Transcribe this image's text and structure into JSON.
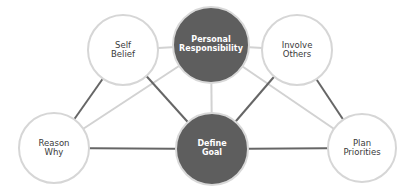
{
  "diagram": {
    "nodes": [
      {
        "id": "self-belief",
        "line1": "Self",
        "line2": "Belief",
        "style": "light",
        "cx": 123,
        "cy": 50,
        "r": 36
      },
      {
        "id": "personal-responsibility",
        "line1": "Personal",
        "line2": "Responsibility",
        "style": "dark",
        "cx": 211,
        "cy": 45,
        "r": 39
      },
      {
        "id": "involve-others",
        "line1": "Involve",
        "line2": "Others",
        "style": "light",
        "cx": 297,
        "cy": 50,
        "r": 36
      },
      {
        "id": "reason-why",
        "line1": "Reason",
        "line2": "Why",
        "style": "light",
        "cx": 54,
        "cy": 148,
        "r": 36
      },
      {
        "id": "define-goal",
        "line1": "Define",
        "line2": "Goal",
        "style": "dark",
        "cx": 212,
        "cy": 149,
        "r": 37
      },
      {
        "id": "plan-priorities",
        "line1": "Plan",
        "line2": "Priorities",
        "style": "light",
        "cx": 362,
        "cy": 148,
        "r": 35
      }
    ],
    "edges": [
      {
        "from": "self-belief",
        "to": "personal-responsibility",
        "tone": "light"
      },
      {
        "from": "personal-responsibility",
        "to": "involve-others",
        "tone": "light"
      },
      {
        "from": "personal-responsibility",
        "to": "define-goal",
        "tone": "light"
      },
      {
        "from": "reason-why",
        "to": "personal-responsibility",
        "tone": "light"
      },
      {
        "from": "personal-responsibility",
        "to": "plan-priorities",
        "tone": "light"
      },
      {
        "from": "self-belief",
        "to": "reason-why",
        "tone": "dark"
      },
      {
        "from": "self-belief",
        "to": "define-goal",
        "tone": "dark"
      },
      {
        "from": "involve-others",
        "to": "define-goal",
        "tone": "dark"
      },
      {
        "from": "involve-others",
        "to": "plan-priorities",
        "tone": "dark"
      },
      {
        "from": "reason-why",
        "to": "define-goal",
        "tone": "dark"
      },
      {
        "from": "define-goal",
        "to": "plan-priorities",
        "tone": "dark"
      }
    ],
    "colors": {
      "dark_fill": "#5e5e5e",
      "dark_line": "#666666",
      "light_line": "#d2d2d2",
      "outline": "#d6d6d6",
      "text_dark": "#3a3a3a",
      "text_light": "#ffffff"
    }
  }
}
